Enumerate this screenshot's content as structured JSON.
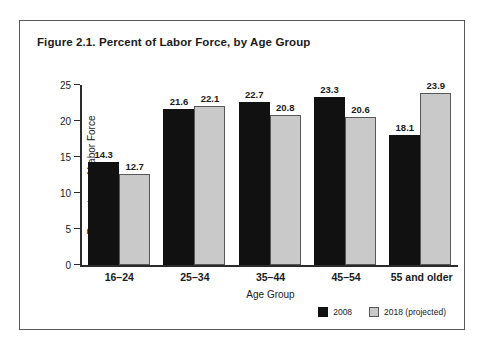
{
  "figure": {
    "title": "Figure 2.1. Percent of Labor Force, by Age Group",
    "border_color": "#5a5a5a"
  },
  "chart_data": {
    "type": "bar",
    "title": "Figure 2.1. Percent of Labor Force, by Age Group",
    "xlabel": "Age Group",
    "ylabel": "Percentage of Labor Force",
    "categories": [
      "16–24",
      "25–34",
      "35–44",
      "45–54",
      "55 and older"
    ],
    "series": [
      {
        "name": "2008",
        "color": "#111111",
        "values": [
          14.3,
          21.6,
          22.7,
          23.3,
          18.1
        ]
      },
      {
        "name": "2018 (projected)",
        "color": "#c9c9c9",
        "values": [
          12.7,
          22.1,
          20.8,
          20.6,
          23.9
        ]
      }
    ],
    "ylim": [
      0,
      25
    ],
    "yticks": [
      0,
      5,
      10,
      15,
      20,
      25
    ],
    "ytick_labels": [
      "0",
      "5",
      "10",
      "15",
      "20",
      "25"
    ],
    "grid": false,
    "legend_position": "bottom-right",
    "value_labels": true
  }
}
